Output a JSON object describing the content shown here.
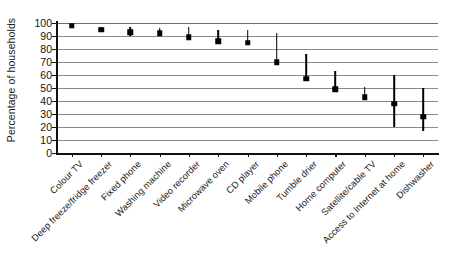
{
  "chart_data": {
    "type": "scatter",
    "title": "",
    "xlabel": "",
    "ylabel": "Percentage of households",
    "ylim": [
      0,
      100
    ],
    "ytick_step": 10,
    "yticks": [
      100,
      90,
      80,
      70,
      60,
      50,
      40,
      30,
      20,
      10,
      0
    ],
    "grid": true,
    "legend": "none",
    "marker": "black-square",
    "error_bars": "vertical-range-line",
    "categories": [
      "Colour TV",
      "Deep freeze/fridge freezer",
      "Fixed phone",
      "Washing machine",
      "Video recorder",
      "Microwave oven",
      "CD player",
      "Mobile phone",
      "Tumble drier",
      "Home computer",
      "Satellite/cable TV",
      "Access to Internet at home",
      "Dishwasher"
    ],
    "values": [
      98,
      95,
      93,
      92,
      89,
      86,
      85,
      70,
      57,
      49,
      43,
      38,
      28
    ],
    "range_low": [
      98,
      93,
      90,
      90,
      89,
      86,
      85,
      70,
      57,
      49,
      43,
      20,
      17
    ],
    "range_high": [
      99,
      97,
      97,
      96,
      97,
      95,
      95,
      92,
      76,
      63,
      51,
      60,
      50
    ],
    "series": [
      {
        "name": "Percentage of households",
        "values": [
          98,
          95,
          93,
          92,
          89,
          86,
          85,
          70,
          57,
          49,
          43,
          38,
          28
        ]
      }
    ],
    "colors": {
      "marker": "#000000",
      "error_bar": "#000000",
      "gridline": "#8a8a8a",
      "axis": "#111111",
      "background": "#ffffff"
    }
  },
  "axis": {
    "y_title": "Percentage of households"
  }
}
